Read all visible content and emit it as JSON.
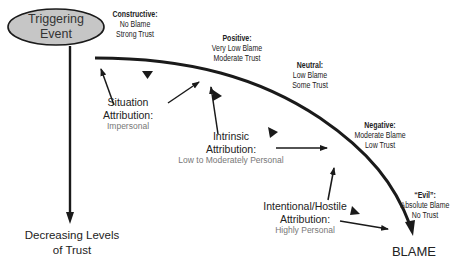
{
  "trigger": {
    "line1": "Triggering",
    "line2": "Event"
  },
  "axis_label": {
    "line1": "Decreasing Levels",
    "line2": "of Trust"
  },
  "end_label": "BLAME",
  "stages": [
    {
      "title": "Constructive:",
      "line1": "No Blame",
      "line2": "Strong Trust"
    },
    {
      "title": "Positive:",
      "line1": "Very Low Blame",
      "line2": "Moderate Trust"
    },
    {
      "title": "Neutral:",
      "line1": "Low Blame",
      "line2": "Some Trust"
    },
    {
      "title": "Negative:",
      "line1": "Moderate Blame",
      "line2": "Low Trust"
    },
    {
      "title": "“Evil”:",
      "line1": "Absolute Blame",
      "line2": "No Trust"
    }
  ],
  "attributions": [
    {
      "line1": "Situation",
      "line2": "Attribution:",
      "sub": "Impersonal"
    },
    {
      "line1": "Intrinsic",
      "line2": "Attribution:",
      "sub": "Low to Moderately Personal"
    },
    {
      "line1": "Intentional/Hostile",
      "line2": "Attribution:",
      "sub": "Highly Personal"
    }
  ],
  "colors": {
    "ellipse_fill": "#c6c6c6",
    "stroke": "#1a1a1a",
    "subtext": "#777777"
  }
}
